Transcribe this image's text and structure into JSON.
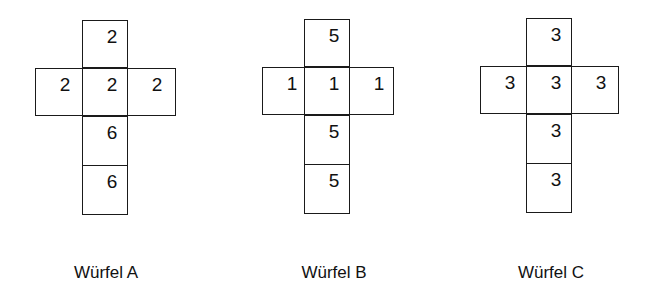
{
  "dice": [
    {
      "label": "Würfel A",
      "faces": {
        "top": "2",
        "left": "2",
        "center": "2",
        "right": "2",
        "below": "6",
        "bottom": "6"
      }
    },
    {
      "label": "Würfel B",
      "faces": {
        "top": "5",
        "left": "1",
        "center": "1",
        "right": "1",
        "below": "5",
        "bottom": "5"
      }
    },
    {
      "label": "Würfel C",
      "faces": {
        "top": "3",
        "left": "3",
        "center": "3",
        "right": "3",
        "below": "3",
        "bottom": "3"
      }
    }
  ]
}
